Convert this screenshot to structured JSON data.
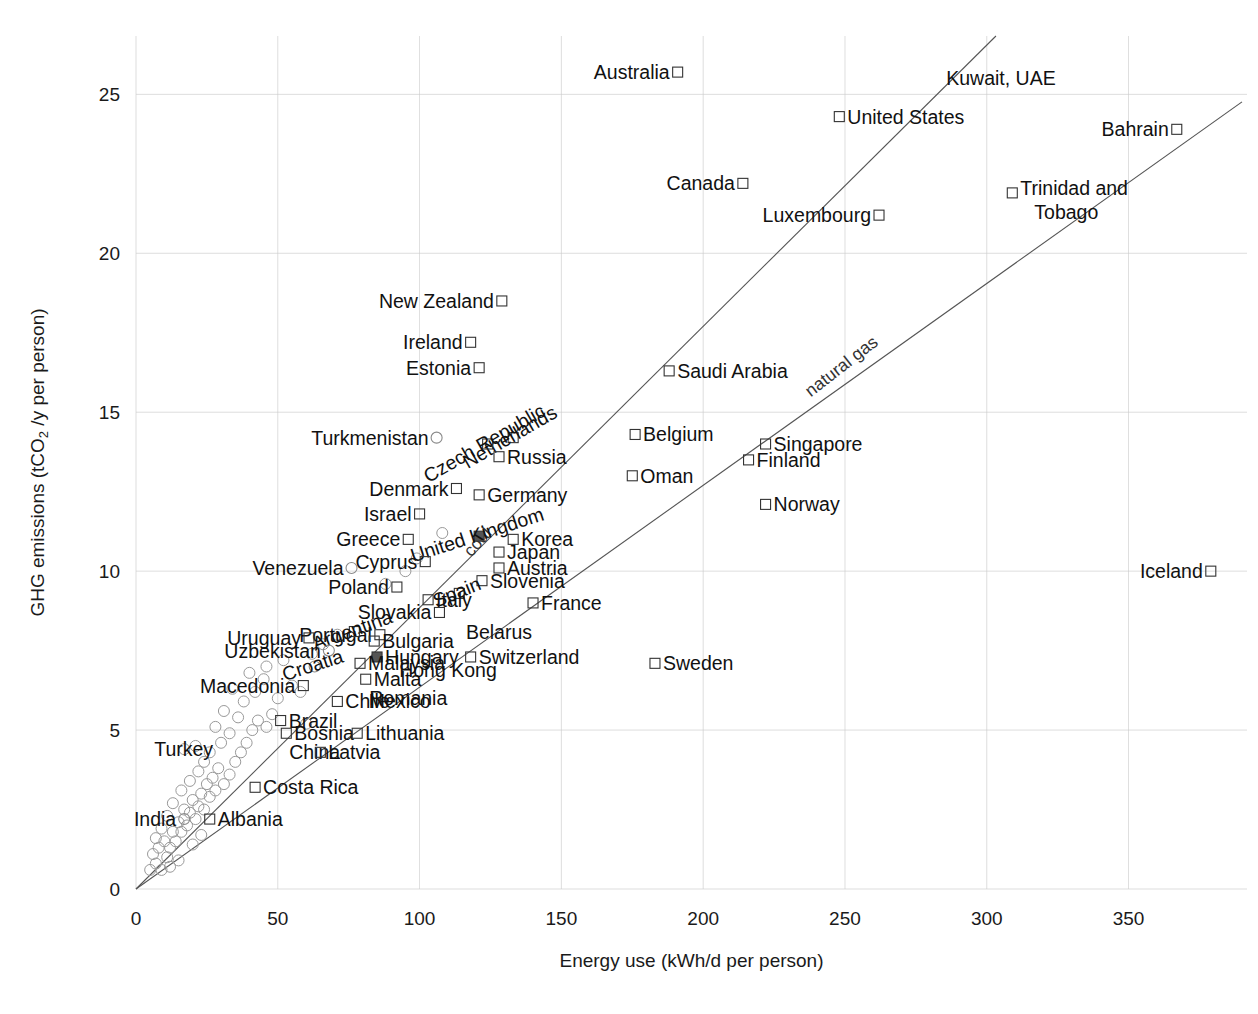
{
  "chart_data": {
    "type": "scatter",
    "title": "",
    "xlabel": "Energy use (kWh/d per person)",
    "ylabel": "GHG emissions (tCO2 /y per person)",
    "ylabel_parts": {
      "pre": "GHG emissions (tCO",
      "sub": "2",
      "post": " /y per person)"
    },
    "xlim": [
      0,
      385
    ],
    "ylim": [
      0,
      27
    ],
    "xticks": [
      0,
      50,
      100,
      150,
      200,
      250,
      300,
      350
    ],
    "yticks": [
      0,
      5,
      10,
      15,
      20,
      25
    ],
    "grid": true,
    "grid_color": "#cccccc",
    "legend_position": "none",
    "trend_lines": [
      {
        "name": "coal",
        "label": "coal",
        "slope": 0.0885,
        "label_x": 122,
        "label_y": 10.8,
        "angle": -48
      },
      {
        "name": "natural gas",
        "label": "natural gas",
        "slope": 0.0635,
        "label_x": 250,
        "label_y": 16.3,
        "angle": -38
      }
    ],
    "marker_styles": {
      "labeled_square": {
        "shape": "square",
        "stroke": "#333333",
        "fill": "none",
        "size": 11
      },
      "labeled_circle": {
        "shape": "circle",
        "stroke": "#888888",
        "fill": "none",
        "size": 11
      },
      "highlight": {
        "shape": "square",
        "stroke": "#555555",
        "fill": "#555555",
        "size": 11
      },
      "unlabeled_circle": {
        "shape": "circle",
        "stroke": "#999999",
        "fill": "none",
        "size": 11
      }
    },
    "points": [
      {
        "name": "Australia",
        "x": 191,
        "y": 25.7,
        "marker": "square",
        "label_side": "left"
      },
      {
        "name": "Kuwait, UAE",
        "x": 305,
        "y": 25.5,
        "marker": "none",
        "label_side": "center"
      },
      {
        "name": "United States",
        "x": 248,
        "y": 24.3,
        "marker": "square",
        "label_side": "right"
      },
      {
        "name": "Bahrain",
        "x": 367,
        "y": 23.9,
        "marker": "square",
        "label_side": "left"
      },
      {
        "name": "Canada",
        "x": 214,
        "y": 22.2,
        "marker": "square",
        "label_side": "left"
      },
      {
        "name": "Trinidad and Tobago",
        "x": 309,
        "y": 21.9,
        "marker": "square",
        "label_side": "right"
      },
      {
        "name": "Luxembourg",
        "x": 262,
        "y": 21.2,
        "marker": "square",
        "label_side": "left"
      },
      {
        "name": "New Zealand",
        "x": 129,
        "y": 18.5,
        "marker": "square",
        "label_side": "left"
      },
      {
        "name": "Ireland",
        "x": 118,
        "y": 17.2,
        "marker": "square",
        "label_side": "left"
      },
      {
        "name": "Estonia",
        "x": 121,
        "y": 16.4,
        "marker": "square",
        "label_side": "left"
      },
      {
        "name": "Saudi Arabia",
        "x": 188,
        "y": 16.3,
        "marker": "square",
        "label_side": "right"
      },
      {
        "name": "Netherlands",
        "x": 133,
        "y": 14.2,
        "marker": "square",
        "label_side": "rot",
        "angle": -30
      },
      {
        "name": "Belgium",
        "x": 176,
        "y": 14.3,
        "marker": "square",
        "label_side": "right"
      },
      {
        "name": "Singapore",
        "x": 222,
        "y": 14.0,
        "marker": "square",
        "label_side": "right"
      },
      {
        "name": "Czech Republic",
        "x": 124,
        "y": 14.0,
        "marker": "square",
        "label_side": "rot",
        "angle": -30
      },
      {
        "name": "Turkmenistan",
        "x": 106,
        "y": 14.2,
        "marker": "circle",
        "label_side": "left"
      },
      {
        "name": "Finland",
        "x": 216,
        "y": 13.5,
        "marker": "square",
        "label_side": "right"
      },
      {
        "name": "Russia",
        "x": 128,
        "y": 13.6,
        "marker": "square",
        "label_side": "right"
      },
      {
        "name": "Oman",
        "x": 175,
        "y": 13.0,
        "marker": "square",
        "label_side": "right"
      },
      {
        "name": "Germany",
        "x": 121,
        "y": 12.4,
        "marker": "square",
        "label_side": "right"
      },
      {
        "name": "Denmark",
        "x": 113,
        "y": 12.6,
        "marker": "square",
        "label_side": "left"
      },
      {
        "name": "Norway",
        "x": 222,
        "y": 12.1,
        "marker": "square",
        "label_side": "right"
      },
      {
        "name": "Israel",
        "x": 100,
        "y": 11.8,
        "marker": "square",
        "label_side": "left"
      },
      {
        "name": "United Kingdom",
        "x": 121,
        "y": 11.1,
        "marker": "highlight",
        "label_side": "rot",
        "angle": -18
      },
      {
        "name": "Korea",
        "x": 133,
        "y": 11.0,
        "marker": "square",
        "label_side": "right"
      },
      {
        "name": "Greece",
        "x": 96,
        "y": 11.0,
        "marker": "square",
        "label_side": "left"
      },
      {
        "name": "Japan",
        "x": 128,
        "y": 10.6,
        "marker": "square",
        "label_side": "right"
      },
      {
        "name": "Cyprus",
        "x": 102,
        "y": 10.3,
        "marker": "square",
        "label_side": "left"
      },
      {
        "name": "Austria",
        "x": 128,
        "y": 10.1,
        "marker": "square",
        "label_side": "right"
      },
      {
        "name": "Iceland",
        "x": 379,
        "y": 10.0,
        "marker": "square",
        "label_side": "left"
      },
      {
        "name": "Venezuela",
        "x": 76,
        "y": 10.1,
        "marker": "circle",
        "label_side": "left"
      },
      {
        "name": "Slovenia",
        "x": 122,
        "y": 9.7,
        "marker": "square",
        "label_side": "right"
      },
      {
        "name": "Poland",
        "x": 92,
        "y": 9.5,
        "marker": "square",
        "label_side": "left"
      },
      {
        "name": "Spain",
        "x": 114,
        "y": 9.3,
        "marker": "square",
        "label_side": "rot",
        "angle": -22
      },
      {
        "name": "Italy",
        "x": 103,
        "y": 9.1,
        "marker": "square",
        "label_side": "right"
      },
      {
        "name": "France",
        "x": 140,
        "y": 9.0,
        "marker": "square",
        "label_side": "right"
      },
      {
        "name": "Slovakia",
        "x": 107,
        "y": 8.7,
        "marker": "square",
        "label_side": "left"
      },
      {
        "name": "Portugal",
        "x": 86,
        "y": 8.0,
        "marker": "square",
        "label_side": "left"
      },
      {
        "name": "Argentina",
        "x": 77,
        "y": 8.1,
        "marker": "square",
        "label_side": "rot",
        "angle": -20
      },
      {
        "name": "Belarus",
        "x": 128,
        "y": 8.1,
        "marker": "none",
        "label_side": "center"
      },
      {
        "name": "Bulgaria",
        "x": 84,
        "y": 7.8,
        "marker": "square",
        "label_side": "right"
      },
      {
        "name": "Uruguay",
        "x": 61,
        "y": 7.9,
        "marker": "square",
        "label_side": "left"
      },
      {
        "name": "Uzbekistan",
        "x": 68,
        "y": 7.5,
        "marker": "circle",
        "label_side": "left"
      },
      {
        "name": "Hungary",
        "x": 85,
        "y": 7.3,
        "marker": "highlight",
        "label_side": "right"
      },
      {
        "name": "Switzerland",
        "x": 118,
        "y": 7.3,
        "marker": "square",
        "label_side": "right"
      },
      {
        "name": "Malaysia",
        "x": 79,
        "y": 7.1,
        "marker": "square",
        "label_side": "right"
      },
      {
        "name": "Croatia",
        "x": 63,
        "y": 7.0,
        "marker": "circle",
        "label_side": "rot",
        "angle": -18
      },
      {
        "name": "Hong Kong",
        "x": 110,
        "y": 6.9,
        "marker": "none",
        "label_side": "center"
      },
      {
        "name": "Malta",
        "x": 81,
        "y": 6.6,
        "marker": "square",
        "label_side": "right"
      },
      {
        "name": "Macedonia",
        "x": 59,
        "y": 6.4,
        "marker": "square",
        "label_side": "left"
      },
      {
        "name": "Sweden",
        "x": 183,
        "y": 7.1,
        "marker": "square",
        "label_side": "right"
      },
      {
        "name": "Romania",
        "x": 96,
        "y": 6.0,
        "marker": "none",
        "label_side": "center"
      },
      {
        "name": "Chile",
        "x": 71,
        "y": 5.9,
        "marker": "square",
        "label_side": "right"
      },
      {
        "name": "Mexico",
        "x": 93,
        "y": 5.9,
        "marker": "none",
        "label_side": "center"
      },
      {
        "name": "Brazil",
        "x": 51,
        "y": 5.3,
        "marker": "square",
        "label_side": "right"
      },
      {
        "name": "Bosnia",
        "x": 53,
        "y": 4.9,
        "marker": "square",
        "label_side": "right"
      },
      {
        "name": "Lithuania",
        "x": 78,
        "y": 4.9,
        "marker": "square",
        "label_side": "right"
      },
      {
        "name": "Turkey",
        "x": 30,
        "y": 4.4,
        "marker": "none",
        "label_side": "left"
      },
      {
        "name": "China",
        "x": 63,
        "y": 4.3,
        "marker": "none",
        "label_side": "center"
      },
      {
        "name": "Latvia",
        "x": 65,
        "y": 4.3,
        "marker": "square",
        "label_side": "right"
      },
      {
        "name": "Costa Rica",
        "x": 42,
        "y": 3.2,
        "marker": "square",
        "label_side": "right"
      },
      {
        "name": "Albania",
        "x": 26,
        "y": 2.2,
        "marker": "square",
        "label_side": "right"
      },
      {
        "name": "India",
        "x": 17,
        "y": 2.2,
        "marker": "circle",
        "label_side": "left"
      }
    ],
    "unlabeled_points": [
      {
        "x": 5,
        "y": 0.6
      },
      {
        "x": 7,
        "y": 0.8
      },
      {
        "x": 9,
        "y": 0.6
      },
      {
        "x": 6,
        "y": 1.1
      },
      {
        "x": 8,
        "y": 1.3
      },
      {
        "x": 11,
        "y": 1.0
      },
      {
        "x": 10,
        "y": 1.5
      },
      {
        "x": 12,
        "y": 1.3
      },
      {
        "x": 13,
        "y": 1.8
      },
      {
        "x": 9,
        "y": 1.9
      },
      {
        "x": 14,
        "y": 1.5
      },
      {
        "x": 15,
        "y": 2.1
      },
      {
        "x": 16,
        "y": 1.8
      },
      {
        "x": 11,
        "y": 2.3
      },
      {
        "x": 17,
        "y": 2.5
      },
      {
        "x": 18,
        "y": 2.0
      },
      {
        "x": 19,
        "y": 2.4
      },
      {
        "x": 20,
        "y": 2.8
      },
      {
        "x": 13,
        "y": 2.7
      },
      {
        "x": 21,
        "y": 2.2
      },
      {
        "x": 22,
        "y": 2.6
      },
      {
        "x": 23,
        "y": 3.0
      },
      {
        "x": 16,
        "y": 3.1
      },
      {
        "x": 24,
        "y": 2.5
      },
      {
        "x": 25,
        "y": 3.3
      },
      {
        "x": 26,
        "y": 2.9
      },
      {
        "x": 27,
        "y": 3.5
      },
      {
        "x": 19,
        "y": 3.4
      },
      {
        "x": 28,
        "y": 3.1
      },
      {
        "x": 29,
        "y": 3.8
      },
      {
        "x": 22,
        "y": 3.7
      },
      {
        "x": 31,
        "y": 3.3
      },
      {
        "x": 24,
        "y": 4.0
      },
      {
        "x": 33,
        "y": 3.6
      },
      {
        "x": 26,
        "y": 4.3
      },
      {
        "x": 35,
        "y": 4.0
      },
      {
        "x": 21,
        "y": 4.5
      },
      {
        "x": 30,
        "y": 4.6
      },
      {
        "x": 37,
        "y": 4.3
      },
      {
        "x": 17,
        "y": 4.4
      },
      {
        "x": 33,
        "y": 4.9
      },
      {
        "x": 39,
        "y": 4.6
      },
      {
        "x": 28,
        "y": 5.1
      },
      {
        "x": 41,
        "y": 5.0
      },
      {
        "x": 36,
        "y": 5.4
      },
      {
        "x": 43,
        "y": 5.3
      },
      {
        "x": 31,
        "y": 5.6
      },
      {
        "x": 46,
        "y": 5.1
      },
      {
        "x": 38,
        "y": 5.9
      },
      {
        "x": 48,
        "y": 5.5
      },
      {
        "x": 42,
        "y": 6.2
      },
      {
        "x": 34,
        "y": 6.3
      },
      {
        "x": 50,
        "y": 6.0
      },
      {
        "x": 45,
        "y": 6.6
      },
      {
        "x": 55,
        "y": 6.4
      },
      {
        "x": 40,
        "y": 6.8
      },
      {
        "x": 58,
        "y": 6.2
      },
      {
        "x": 62,
        "y": 7.4
      },
      {
        "x": 52,
        "y": 7.2
      },
      {
        "x": 66,
        "y": 7.7
      },
      {
        "x": 71,
        "y": 8.0
      },
      {
        "x": 95,
        "y": 10.0
      },
      {
        "x": 99,
        "y": 10.4
      },
      {
        "x": 108,
        "y": 11.2
      },
      {
        "x": 88,
        "y": 9.6
      },
      {
        "x": 46,
        "y": 7.0
      },
      {
        "x": 60,
        "y": 5.2
      },
      {
        "x": 15,
        "y": 0.9
      },
      {
        "x": 12,
        "y": 0.7
      },
      {
        "x": 7,
        "y": 1.6
      },
      {
        "x": 23,
        "y": 1.7
      },
      {
        "x": 20,
        "y": 1.4
      }
    ]
  }
}
